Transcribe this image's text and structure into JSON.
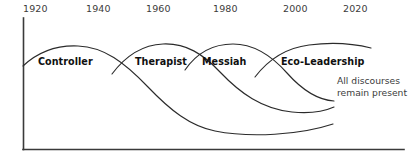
{
  "figure": {
    "title": "",
    "background_color": "#ffffff",
    "line_color": "#2b2b2b",
    "axis_color": "#3a3a3a",
    "label_color": "#101010",
    "tick_color": "#3c3c3c"
  },
  "axis": {
    "ticks": [
      {
        "label": "1920",
        "x": 23
      },
      {
        "label": "1940",
        "x": 86
      },
      {
        "label": "1960",
        "x": 146
      },
      {
        "label": "1980",
        "x": 213
      },
      {
        "label": "2000",
        "x": 283
      },
      {
        "label": "2020",
        "x": 343
      }
    ],
    "tick_label_y": 11,
    "axis_top_y": 18,
    "axis_bottom_y": 150,
    "axis_left_x": 23,
    "axis_right_x": 404
  },
  "waves": [
    {
      "name": "controller",
      "label": "Controller",
      "label_x": 38,
      "label_y": 62,
      "peak_year": 1935,
      "path": "M23,66 C38,52 56,45 78,46 C104,47 124,62 148,87 C170,110 190,126 215,131 C250,138 300,135 333,124"
    },
    {
      "name": "therapist",
      "label": "Therapist",
      "label_x": 135,
      "label_y": 62,
      "peak_year": 1975,
      "path": "M112,74 C124,58 140,45 163,44 C186,43 203,54 220,72 C240,93 262,109 292,112 C312,114 325,111 334,107"
    },
    {
      "name": "messiah",
      "label": "Messiah",
      "label_x": 202,
      "label_y": 62,
      "peak_year": 1993,
      "path": "M185,70 C196,54 212,44 233,44 C254,44 271,55 287,73 C303,91 318,100 334,101"
    },
    {
      "name": "eco-leadership",
      "label": "Eco-Leadership",
      "label_x": 281,
      "label_y": 62,
      "peak_year": 2020,
      "path": "M255,77 C268,60 285,48 309,45 C332,42 355,44 371,48"
    }
  ],
  "annotation": {
    "line1": "All discourses",
    "line2": "remain present",
    "x": 337,
    "y1": 83,
    "y2": 95
  }
}
